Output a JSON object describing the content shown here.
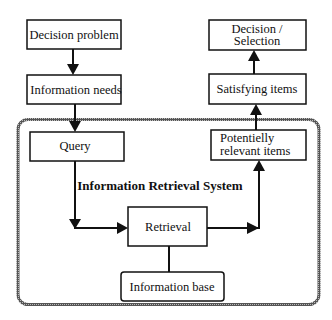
{
  "diagram": {
    "system_label": "Information Retrieval System",
    "nodes": {
      "decision_problem": {
        "label": [
          "Decision problem"
        ]
      },
      "information_needs": {
        "label": [
          "Information needs"
        ]
      },
      "query": {
        "label": [
          "Query"
        ]
      },
      "retrieval": {
        "label": [
          "Retrieval"
        ]
      },
      "information_base": {
        "label": [
          "Information base"
        ]
      },
      "potentially_relevant_items": {
        "label": [
          "Potentielly",
          "relevant items"
        ]
      },
      "satisfying_items": {
        "label": [
          "Satisfying items"
        ]
      },
      "decision_selection": {
        "label": [
          "Decision /",
          "Selection"
        ]
      }
    },
    "edges": [
      {
        "from": "decision_problem",
        "to": "information_needs"
      },
      {
        "from": "information_needs",
        "to": "query"
      },
      {
        "from": "query",
        "to": "retrieval"
      },
      {
        "from": "information_base",
        "to": "retrieval",
        "arrow": false
      },
      {
        "from": "retrieval",
        "to": "potentially_relevant_items"
      },
      {
        "from": "potentially_relevant_items",
        "to": "satisfying_items"
      },
      {
        "from": "satisfying_items",
        "to": "decision_selection"
      }
    ]
  }
}
